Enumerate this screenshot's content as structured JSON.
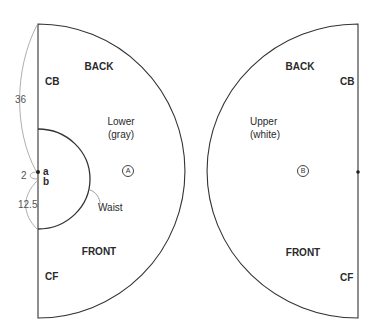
{
  "diagram": {
    "type": "sewing pattern (circle skirt pieces)",
    "pieces": [
      {
        "id": "A",
        "marker": "A",
        "name_line1": "Lower",
        "name_line2": "(gray)",
        "back_label": "BACK",
        "front_label": "FRONT",
        "center_back": "CB",
        "center_front": "CF",
        "waist_label": "Waist",
        "point_a": "a",
        "point_b": "b"
      },
      {
        "id": "B",
        "marker": "B",
        "name_line1": "Upper",
        "name_line2": "(white)",
        "back_label": "BACK",
        "front_label": "FRONT",
        "center_back": "CB",
        "center_front": "CF"
      }
    ],
    "dimensions": {
      "upper_length": "36",
      "gap": "2",
      "waist_radius": "12.5"
    },
    "colors": {
      "stroke": "#333333",
      "dim_stroke": "#999999",
      "background": "#ffffff"
    }
  }
}
